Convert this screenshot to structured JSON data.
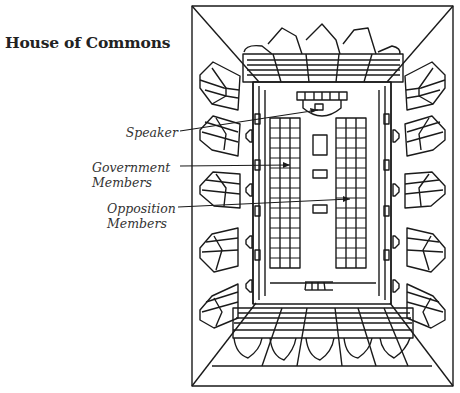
{
  "title": "House of Commons",
  "labels": {
    "speaker": "Speaker",
    "government_line1": "Government",
    "government_line2": "Members",
    "opposition_line1": "Opposition",
    "opposition_line2": "Members"
  },
  "colors": {
    "ink": "#1a1a1a",
    "background": "#ffffff"
  }
}
